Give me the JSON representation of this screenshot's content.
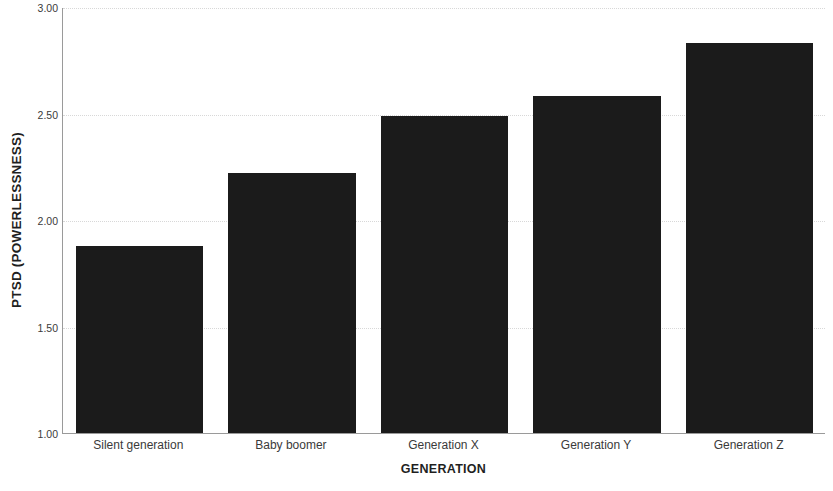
{
  "chart_data": {
    "type": "bar",
    "title": "",
    "subtitle": "",
    "xlabel": "GENERATION",
    "ylabel": "PTSD (POWERLESSNESS)",
    "categories": [
      "Silent generation",
      "Baby boomer",
      "Generation X",
      "Generation Y",
      "Generation Z"
    ],
    "values": [
      1.88,
      2.22,
      2.49,
      2.58,
      2.83
    ],
    "ylim": [
      1.0,
      3.0
    ],
    "yticks": [
      1.0,
      1.5,
      2.0,
      2.5,
      3.0
    ],
    "ytick_labels": [
      "1.00",
      "1.50",
      "2.00",
      "2.50",
      "3.00"
    ],
    "grid": true,
    "grid_axis": "y",
    "legend": false,
    "legend_position": "none",
    "bar_color": "#1b1b1b",
    "grid_color": "#d8d8d8",
    "axis_color": "#9a9a9a",
    "text_color": "#3a3a3a"
  },
  "axes": {
    "y_title": "PTSD (POWERLESSNESS)",
    "x_title": "GENERATION"
  }
}
